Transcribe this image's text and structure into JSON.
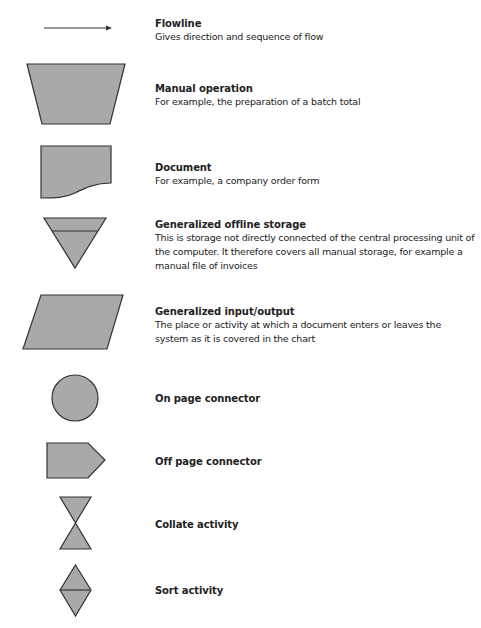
{
  "colors": {
    "fill": "#a9a9a9",
    "stroke": "#333333",
    "text": "#222222"
  },
  "symbols": [
    {
      "icon": "flowline-arrow-icon",
      "title": "Flowline",
      "description": "Gives direction and sequence of flow"
    },
    {
      "icon": "manual-operation-trapezoid-icon",
      "title": "Manual operation",
      "description": "For example, the preparation of a batch total"
    },
    {
      "icon": "document-icon",
      "title": "Document",
      "description": "For example, a company order form"
    },
    {
      "icon": "offline-storage-triangle-icon",
      "title": "Generalized offline storage",
      "description": "This is storage not directly connected of the central processing unit of the computer. It therefore covers all manual storage, for example a manual file of invoices"
    },
    {
      "icon": "input-output-parallelogram-icon",
      "title": "Generalized input/output",
      "description": "The place or activity at which a document enters or leaves the system as it is covered in the chart"
    },
    {
      "icon": "on-page-connector-circle-icon",
      "title": "On page connector",
      "description": ""
    },
    {
      "icon": "off-page-connector-pentagon-icon",
      "title": "Off page connector",
      "description": ""
    },
    {
      "icon": "collate-hourglass-icon",
      "title": "Collate activity",
      "description": ""
    },
    {
      "icon": "sort-diamond-icon",
      "title": "Sort activity",
      "description": ""
    }
  ]
}
